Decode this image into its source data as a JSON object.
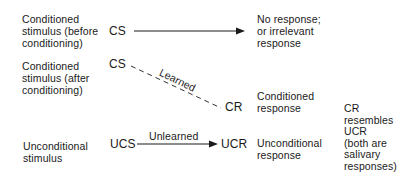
{
  "rows": [
    {
      "label": "Conditioned\nstimulus (before\nconditioning)",
      "stimulus": "CS",
      "link": {
        "style": "solid-arrow",
        "label": ""
      },
      "response_abbr": "",
      "response_label": "No response;\nor irrelevant\nresponse"
    },
    {
      "label": "Conditioned\nstimulus (after\nconditioning)",
      "stimulus": "CS",
      "link": {
        "style": "dashed",
        "label": "Learned"
      },
      "response_abbr": "CR",
      "response_label": "Conditioned\nresponse"
    },
    {
      "label": "Unconditional\nstimulus",
      "stimulus": "UCS",
      "link": {
        "style": "solid-arrow",
        "label": "Unlearned"
      },
      "response_abbr": "UCR",
      "response_label": "Unconditional\nresponse"
    }
  ],
  "note": "CR\nresembles\nUCR\n(both are\nsalivary\nresponses)",
  "colors": {
    "ink": "#1a1a1a",
    "background": "#ffffff"
  }
}
